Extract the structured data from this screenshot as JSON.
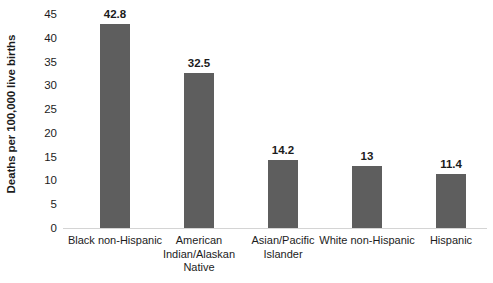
{
  "chart_data": {
    "type": "bar",
    "title": "",
    "subtitle": "",
    "xlabel": "",
    "ylabel": "Deaths per 100,000 live births",
    "categories": [
      "Black non-Hispanic",
      "American Indian/Alaskan Native",
      "Asian/Pacific Islander",
      "White non-Hispanic",
      "Hispanic"
    ],
    "values": [
      42.8,
      32.5,
      14.2,
      13,
      11.4
    ],
    "value_labels": [
      "42.8",
      "32.5",
      "14.2",
      "13",
      "11.4"
    ],
    "ylim": [
      0,
      45
    ],
    "ytick_labels": [
      "0",
      "5",
      "10",
      "15",
      "20",
      "25",
      "30",
      "35",
      "40",
      "45"
    ],
    "ytick_values": [
      0,
      5,
      10,
      15,
      20,
      25,
      30,
      35,
      40,
      45
    ],
    "grid": false,
    "legend": null,
    "bar_color": "#5E5E5E",
    "axis_color": "#D4D4D4",
    "background_color": "#FFFFFF",
    "text_color": "#1C1C1C"
  }
}
